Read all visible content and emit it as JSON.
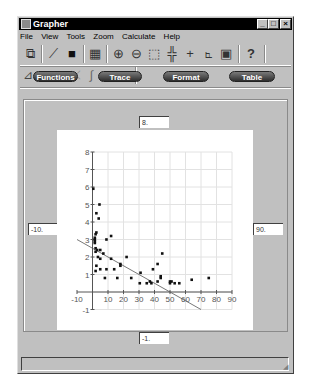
{
  "window": {
    "title": "Grapher",
    "controls": {
      "minimize": "_",
      "maximize": "□",
      "close": "×"
    }
  },
  "menu": [
    {
      "label": "File",
      "accel": "F"
    },
    {
      "label": "View",
      "accel": "V"
    },
    {
      "label": "Tools",
      "accel": "T"
    },
    {
      "label": "Zoom",
      "accel": "Z"
    },
    {
      "label": "Calculate",
      "accel": "C"
    },
    {
      "label": "Help",
      "accel": "H"
    }
  ],
  "toolbar1": [
    {
      "name": "new-graph-icon",
      "glyph": "⧉"
    },
    {
      "name": "draw-function-icon",
      "glyph": "⟋"
    },
    {
      "name": "camera-icon",
      "glyph": "■"
    },
    {
      "name": "grid-layout-icon",
      "glyph": "▦"
    },
    {
      "name": "zoom-in-icon",
      "glyph": "⊕"
    },
    {
      "name": "zoom-out-icon",
      "glyph": "⊖"
    },
    {
      "name": "zoom-box-icon",
      "glyph": "⬚"
    },
    {
      "name": "axes-scale-icon",
      "glyph": "╬"
    },
    {
      "name": "crosshair-icon",
      "glyph": "+"
    },
    {
      "name": "plot-points-icon",
      "glyph": "⦜"
    },
    {
      "name": "table-window-icon",
      "glyph": "▣"
    },
    {
      "name": "help-icon",
      "glyph": "?"
    }
  ],
  "toolbar2": [
    {
      "name": "linear-fit-icon",
      "glyph": "⊿"
    },
    {
      "name": "quadratic-fit-icon",
      "glyph": "∪"
    },
    {
      "name": "cubic-fit-icon",
      "glyph": "∩"
    },
    {
      "name": "exponential-fit-icon",
      "glyph": "⤫"
    },
    {
      "name": "integrate-icon",
      "glyph": "∫"
    },
    {
      "name": "area-fill-icon",
      "glyph": "◢"
    },
    {
      "name": "shaded-curve-icon",
      "glyph": "◡"
    }
  ],
  "tabs": [
    {
      "label": "Functions"
    },
    {
      "label": "Trace"
    },
    {
      "label": "Format"
    },
    {
      "label": "Table"
    }
  ],
  "bounds": {
    "ymax": "8.",
    "ymin": "-1.",
    "xmin": "-10.",
    "xmax": "90."
  },
  "status_text": "",
  "chart_data": {
    "type": "scatter",
    "title": "",
    "xlabel": "",
    "ylabel": "",
    "xlim": [
      -10,
      90
    ],
    "ylim": [
      -1,
      8
    ],
    "grid": true,
    "x_ticks": [
      -10,
      10,
      20,
      30,
      40,
      50,
      60,
      70,
      80,
      90
    ],
    "y_ticks": [
      -1,
      1,
      2,
      3,
      4,
      5,
      6,
      7,
      8
    ],
    "points": [
      [
        0.5,
        5.9
      ],
      [
        4.5,
        5.0
      ],
      [
        2.5,
        4.5
      ],
      [
        4,
        4.2
      ],
      [
        2,
        3.3
      ],
      [
        2.5,
        3.4
      ],
      [
        1.5,
        3.1
      ],
      [
        1.5,
        3.0
      ],
      [
        1.5,
        2.9
      ],
      [
        1.5,
        2.8
      ],
      [
        9,
        3.0
      ],
      [
        12,
        3.2
      ],
      [
        2,
        2.5
      ],
      [
        3,
        2.4
      ],
      [
        5,
        2.4
      ],
      [
        2,
        2.3
      ],
      [
        7,
        2.2
      ],
      [
        3.5,
        2.0
      ],
      [
        5,
        1.9
      ],
      [
        12,
        1.9
      ],
      [
        22,
        2.0
      ],
      [
        18,
        1.6
      ],
      [
        18,
        1.5
      ],
      [
        2.5,
        1.5
      ],
      [
        5,
        1.3
      ],
      [
        2,
        1.2
      ],
      [
        9,
        1.3
      ],
      [
        14,
        1.3
      ],
      [
        8,
        0.8
      ],
      [
        16,
        0.8
      ],
      [
        25,
        0.8
      ],
      [
        31,
        1.1
      ],
      [
        30.5,
        0.5
      ],
      [
        35,
        0.5
      ],
      [
        37,
        0.6
      ],
      [
        38,
        0.5
      ],
      [
        39,
        1.3
      ],
      [
        42,
        1.6
      ],
      [
        42,
        0.6
      ],
      [
        44,
        0.9
      ],
      [
        44,
        0.8
      ],
      [
        45,
        2.2
      ],
      [
        50,
        0.6
      ],
      [
        50,
        0.5
      ],
      [
        51,
        0.6
      ],
      [
        53,
        0.5
      ],
      [
        56,
        0.5
      ],
      [
        64,
        0.7
      ],
      [
        75,
        0.8
      ]
    ],
    "fit_line": {
      "type": "linear",
      "slope": -0.05,
      "intercept": 2.5,
      "x_range": [
        -10,
        70
      ]
    }
  }
}
